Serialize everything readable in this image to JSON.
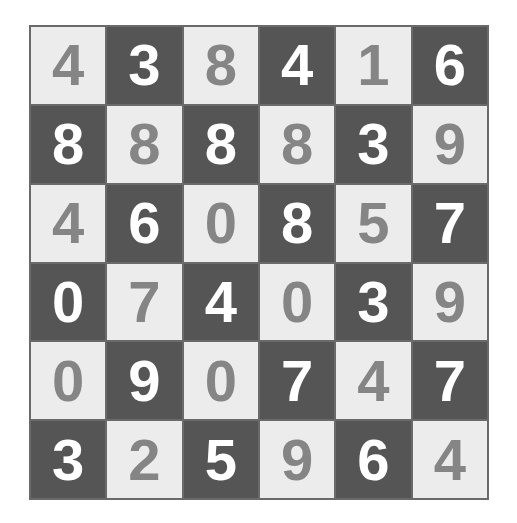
{
  "puzzle": {
    "rows": 6,
    "cols": 6,
    "colors": {
      "light_bg": "#ececec",
      "light_fg": "#858585",
      "dark_bg": "#555555",
      "dark_fg": "#ffffff",
      "border": "#6a6a6a"
    },
    "grid": [
      [
        {
          "v": "4",
          "s": "light"
        },
        {
          "v": "3",
          "s": "dark"
        },
        {
          "v": "8",
          "s": "light"
        },
        {
          "v": "4",
          "s": "dark"
        },
        {
          "v": "1",
          "s": "light"
        },
        {
          "v": "6",
          "s": "dark"
        }
      ],
      [
        {
          "v": "8",
          "s": "dark"
        },
        {
          "v": "8",
          "s": "light"
        },
        {
          "v": "8",
          "s": "dark"
        },
        {
          "v": "8",
          "s": "light"
        },
        {
          "v": "3",
          "s": "dark"
        },
        {
          "v": "9",
          "s": "light"
        }
      ],
      [
        {
          "v": "4",
          "s": "light"
        },
        {
          "v": "6",
          "s": "dark"
        },
        {
          "v": "0",
          "s": "light"
        },
        {
          "v": "8",
          "s": "dark"
        },
        {
          "v": "5",
          "s": "light"
        },
        {
          "v": "7",
          "s": "dark"
        }
      ],
      [
        {
          "v": "0",
          "s": "dark"
        },
        {
          "v": "7",
          "s": "light"
        },
        {
          "v": "4",
          "s": "dark"
        },
        {
          "v": "0",
          "s": "light"
        },
        {
          "v": "3",
          "s": "dark"
        },
        {
          "v": "9",
          "s": "light"
        }
      ],
      [
        {
          "v": "0",
          "s": "light"
        },
        {
          "v": "9",
          "s": "dark"
        },
        {
          "v": "0",
          "s": "light"
        },
        {
          "v": "7",
          "s": "dark"
        },
        {
          "v": "4",
          "s": "light"
        },
        {
          "v": "7",
          "s": "dark"
        }
      ],
      [
        {
          "v": "3",
          "s": "dark"
        },
        {
          "v": "2",
          "s": "light"
        },
        {
          "v": "5",
          "s": "dark"
        },
        {
          "v": "9",
          "s": "light"
        },
        {
          "v": "6",
          "s": "dark"
        },
        {
          "v": "4",
          "s": "light"
        }
      ]
    ]
  }
}
